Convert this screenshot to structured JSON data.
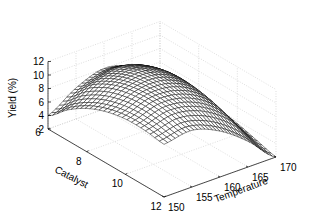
{
  "chart_data": {
    "type": "surface3d",
    "title": "",
    "xlabel": "Catalyst",
    "ylabel": "Temperature",
    "zlabel": "Yield (%)",
    "x_ticks": [
      6,
      8,
      10,
      12
    ],
    "y_ticks": [
      150,
      155,
      160,
      165,
      170
    ],
    "z_ticks": [
      2,
      4,
      6,
      8,
      10,
      12
    ],
    "xlim": [
      6,
      12
    ],
    "ylim": [
      150,
      170
    ],
    "zlim": [
      2,
      12
    ],
    "grid": true,
    "legend": null,
    "surface_description": "Dome-shaped response surface; yield peaks around 11.5% near catalyst 9-10 and temperature ~152-155, decreasing toward high temperature (≈2% at catalyst 12, temp 170) and toward low catalyst (~4% at catalyst 6, temp 150).",
    "grid_x": [
      6,
      7,
      8,
      9,
      10,
      11,
      12
    ],
    "grid_y": [
      150,
      155,
      160,
      165,
      170
    ],
    "z_values": [
      [
        4.0,
        6.6,
        8.0,
        6.8,
        4.0
      ],
      [
        6.5,
        9.0,
        10.0,
        8.4,
        4.5
      ],
      [
        8.4,
        10.6,
        11.2,
        9.2,
        4.6
      ],
      [
        9.6,
        11.4,
        11.5,
        9.2,
        4.2
      ],
      [
        10.2,
        11.6,
        11.1,
        8.6,
        3.6
      ],
      [
        10.2,
        11.2,
        10.2,
        7.4,
        2.8
      ],
      [
        9.8,
        10.4,
        8.8,
        5.8,
        2.0
      ]
    ],
    "mesh_resolution": [
      25,
      30
    ]
  }
}
